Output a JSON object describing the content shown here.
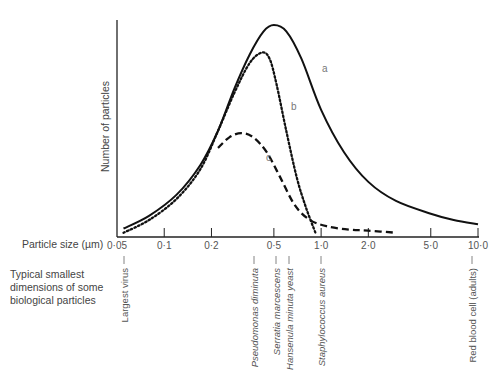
{
  "chart_data": {
    "type": "line",
    "title": "",
    "xlabel": "Particle size (µm)",
    "ylabel": "Number of particles",
    "xscale": "log",
    "xlim": [
      0.05,
      10.0
    ],
    "x_ticks": [
      {
        "value": 0.05,
        "label": "0·05"
      },
      {
        "value": 0.1,
        "label": "0·1"
      },
      {
        "value": 0.2,
        "label": "0·2"
      },
      {
        "value": 0.5,
        "label": "0·5"
      },
      {
        "value": 1.0,
        "label": "1·0"
      },
      {
        "value": 2.0,
        "label": "2·0"
      },
      {
        "value": 5.0,
        "label": "5·0"
      },
      {
        "value": 10.0,
        "label": "10·0"
      }
    ],
    "y_ticks": [],
    "ylim": [
      0,
      1
    ],
    "grid": false,
    "series": [
      {
        "name": "a",
        "style": "solid",
        "points": [
          [
            0.055,
            0.04
          ],
          [
            0.08,
            0.1
          ],
          [
            0.12,
            0.2
          ],
          [
            0.17,
            0.34
          ],
          [
            0.22,
            0.5
          ],
          [
            0.28,
            0.7
          ],
          [
            0.35,
            0.86
          ],
          [
            0.43,
            0.97
          ],
          [
            0.5,
            1.0
          ],
          [
            0.6,
            0.97
          ],
          [
            0.75,
            0.84
          ],
          [
            1.0,
            0.6
          ],
          [
            1.4,
            0.4
          ],
          [
            2.0,
            0.26
          ],
          [
            3.0,
            0.17
          ],
          [
            5.0,
            0.11
          ],
          [
            7.0,
            0.08
          ],
          [
            10.0,
            0.06
          ]
        ]
      },
      {
        "name": "b",
        "style": "dotted",
        "points": [
          [
            0.055,
            0.02
          ],
          [
            0.08,
            0.08
          ],
          [
            0.12,
            0.18
          ],
          [
            0.17,
            0.32
          ],
          [
            0.22,
            0.5
          ],
          [
            0.28,
            0.68
          ],
          [
            0.35,
            0.82
          ],
          [
            0.42,
            0.87
          ],
          [
            0.47,
            0.84
          ],
          [
            0.52,
            0.72
          ],
          [
            0.6,
            0.5
          ],
          [
            0.7,
            0.28
          ],
          [
            0.8,
            0.14
          ],
          [
            0.92,
            0.02
          ]
        ]
      },
      {
        "name": "c",
        "style": "dashed",
        "points": [
          [
            0.22,
            0.42
          ],
          [
            0.26,
            0.47
          ],
          [
            0.31,
            0.49
          ],
          [
            0.37,
            0.47
          ],
          [
            0.45,
            0.4
          ],
          [
            0.55,
            0.28
          ],
          [
            0.68,
            0.15
          ],
          [
            0.85,
            0.08
          ],
          [
            1.1,
            0.05
          ],
          [
            1.5,
            0.035
          ],
          [
            2.0,
            0.03
          ],
          [
            3.0,
            0.02
          ]
        ]
      }
    ],
    "curve_labels": [
      "a",
      "b",
      "c"
    ],
    "annotations": {
      "category_label": "Typical smallest dimensions of some biological particles",
      "particles": [
        {
          "name": "Largest virus",
          "size": 0.05,
          "italic": false
        },
        {
          "name": "Pseudomonas diminuta",
          "size": 0.3,
          "italic": true
        },
        {
          "name": "Serratia marcescens",
          "size": 0.5,
          "italic": true
        },
        {
          "name": "Hansenula minuta yeast",
          "size": 0.58,
          "italic": true
        },
        {
          "name": "Staphylococcus aureus",
          "size": 1.0,
          "italic": true
        },
        {
          "name": "Red blood cell (adults)",
          "size": 7.5,
          "italic": false
        }
      ]
    }
  }
}
